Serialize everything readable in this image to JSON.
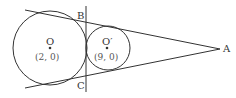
{
  "diagram": {
    "type": "geometry",
    "stroke_color": "#333333",
    "points": {
      "A": {
        "label": "A"
      },
      "B": {
        "label": "B"
      },
      "C": {
        "label": "C"
      }
    },
    "circles": [
      {
        "center_label": "O",
        "coord_label": "(2, 0)",
        "center_x": 2,
        "center_y": 0
      },
      {
        "center_label": "O′",
        "coord_label": "(9, 0)",
        "center_x": 9,
        "center_y": 0
      }
    ],
    "lines": [
      {
        "name": "upper-tangent",
        "through": [
          "B",
          "A"
        ]
      },
      {
        "name": "lower-tangent",
        "through": [
          "C",
          "A"
        ]
      },
      {
        "name": "common-internal-tangent",
        "through": [
          "B",
          "C"
        ]
      }
    ]
  }
}
